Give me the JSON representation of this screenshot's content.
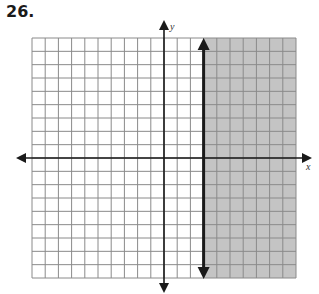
{
  "problem": {
    "number": "26."
  },
  "graph": {
    "x_axis_label": "x",
    "y_axis_label": "y",
    "grid": {
      "cols": 20,
      "rows": 18,
      "x_min": -10,
      "x_max": 10,
      "y_min": -9,
      "y_max": 9
    },
    "boundary_line": {
      "type": "vertical",
      "x": 3,
      "style": "solid"
    },
    "shaded_region": "x >= 3",
    "colors": {
      "shade": "#c4c4c4",
      "grid": "#8a8a8a",
      "axis": "#1a1a1a"
    }
  },
  "chart_data": {
    "type": "inequality-graph",
    "title": "26.",
    "xlabel": "x",
    "ylabel": "y",
    "xlim": [
      -10,
      10
    ],
    "ylim": [
      -9,
      9
    ],
    "grid": true,
    "boundary": {
      "equation": "x = 3",
      "line": "solid"
    },
    "inequality": "x ≥ 3",
    "shaded": "right of x = 3"
  }
}
